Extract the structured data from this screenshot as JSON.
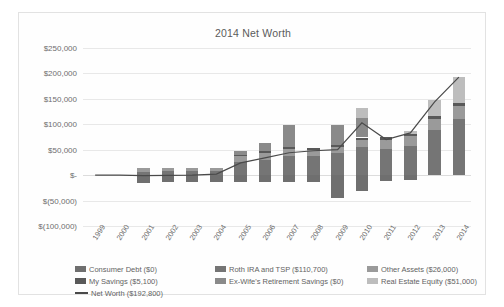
{
  "chart_data": {
    "type": "bar",
    "title": "2014 Net Worth",
    "xlabel": "",
    "ylabel": "",
    "ylim": [
      -100000,
      250000
    ],
    "ytick_labels": [
      "$250,000",
      "$200,000",
      "$150,000",
      "$100,000",
      "$50,000",
      "$-",
      "$(50,000)",
      "$(100,000)"
    ],
    "ytick_values": [
      250000,
      200000,
      150000,
      100000,
      50000,
      0,
      -50000,
      -100000
    ],
    "grid": true,
    "legend_position": "bottom",
    "stacked": true,
    "categories": [
      "1999",
      "2000",
      "2001",
      "2002",
      "2003",
      "2004",
      "2005",
      "2006",
      "2007",
      "2008",
      "2009",
      "2010",
      "2011",
      "2012",
      "2013",
      "2014"
    ],
    "series": [
      {
        "name": "Consumer Debt ($0)",
        "color": "#6f6f6f",
        "values": [
          0,
          0,
          -14500,
          -13500,
          -14000,
          -13000,
          -13500,
          -13000,
          -13500,
          -13000,
          -45000,
          -30500,
          -12500,
          -9500,
          0,
          0
        ]
      },
      {
        "name": "Roth IRA and TSP ($110,700)",
        "color": "#757575",
        "values": [
          0,
          0,
          7000,
          7500,
          7500,
          9000,
          25000,
          30000,
          38000,
          38000,
          43000,
          55000,
          52000,
          57000,
          88000,
          110700
        ]
      },
      {
        "name": "Other Assets ($26,000)",
        "color": "#9a9a9a",
        "values": [
          0,
          0,
          7000,
          6500,
          6500,
          6000,
          12000,
          14000,
          13000,
          12000,
          13000,
          15000,
          18000,
          20000,
          23000,
          26000
        ]
      },
      {
        "name": "My Savings ($5,100)",
        "color": "#595959",
        "values": [
          0,
          0,
          0,
          0,
          0,
          0,
          2500,
          3000,
          3500,
          3000,
          3500,
          4000,
          4500,
          4500,
          5000,
          5100
        ]
      },
      {
        "name": "Ex-Wife's Retirement Savings ($0)",
        "color": "#8a8a8a",
        "values": [
          0,
          0,
          0,
          0,
          0,
          0,
          8000,
          16000,
          44000,
          0,
          40000,
          38000,
          0,
          0,
          0,
          0
        ]
      },
      {
        "name": "Real Estate Equity ($51,000)",
        "color": "#bdbdbd",
        "values": [
          0,
          0,
          0,
          0,
          0,
          0,
          0,
          0,
          0,
          0,
          0,
          20000,
          0,
          5000,
          32000,
          51000
        ]
      }
    ],
    "line_series": {
      "name": "Net Worth ($192,800)",
      "color": "#4a4a4a",
      "values": [
        0,
        0,
        -1000,
        -500,
        0,
        2000,
        24000,
        34000,
        44000,
        48000,
        50000,
        103000,
        70000,
        83000,
        144000,
        192800
      ]
    }
  },
  "legend": {
    "rows": [
      [
        {
          "label": "Consumer Debt ($0)",
          "swatch": "#6f6f6f",
          "kind": "box"
        },
        {
          "label": "Roth IRA and TSP ($110,700)",
          "swatch": "#757575",
          "kind": "box"
        },
        {
          "label": "Other Assets ($26,000)",
          "swatch": "#9a9a9a",
          "kind": "box"
        }
      ],
      [
        {
          "label": "My Savings ($5,100)",
          "swatch": "#595959",
          "kind": "box"
        },
        {
          "label": "Ex-Wife's Retirement Savings ($0)",
          "swatch": "#8a8a8a",
          "kind": "box"
        },
        {
          "label": "Real Estate Equity ($51,000)",
          "swatch": "#bdbdbd",
          "kind": "box"
        }
      ],
      [
        {
          "label": "Net Worth ($192,800)",
          "swatch": "#4a4a4a",
          "kind": "line"
        }
      ]
    ]
  }
}
